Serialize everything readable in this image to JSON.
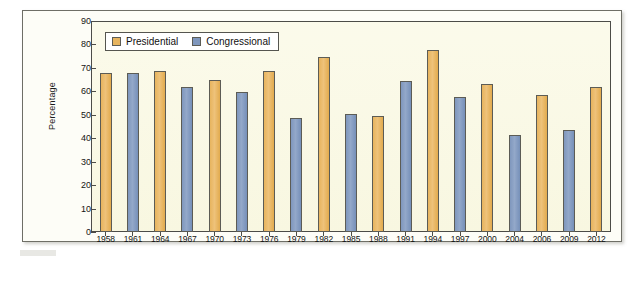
{
  "chart_data": {
    "type": "bar",
    "title": "",
    "xlabel": "",
    "ylabel": "Percentage",
    "ylim": [
      0,
      90
    ],
    "ytick_step": 10,
    "yticks": [
      90,
      80,
      70,
      60,
      50,
      40,
      30,
      20,
      10,
      0
    ],
    "grid": false,
    "legend_position": "top-left",
    "categories": [
      "1958",
      "1961",
      "1964",
      "1967",
      "1970",
      "1973",
      "1976",
      "1979",
      "1982",
      "1985",
      "1988",
      "1991",
      "1994",
      "1997",
      "2000",
      "2004",
      "2006",
      "2009",
      "2012"
    ],
    "series": [
      {
        "name": "Presidential",
        "color": "#e7b45e",
        "values": [
          68.0,
          null,
          68.8,
          null,
          64.8,
          null,
          68.6,
          null,
          74.8,
          null,
          49.3,
          null,
          77.8,
          null,
          63.2,
          null,
          58.3,
          null,
          62.0
        ]
      },
      {
        "name": "Congressional",
        "color": "#7f97bd",
        "values": [
          null,
          68.0,
          null,
          61.8,
          null,
          59.7,
          null,
          48.6,
          null,
          50.5,
          null,
          64.5,
          null,
          57.5,
          null,
          41.5,
          null,
          43.5,
          null
        ]
      }
    ],
    "bars": [
      {
        "category": "1958",
        "series": "Presidential",
        "value": 68.0
      },
      {
        "category": "1961",
        "series": "Congressional",
        "value": 68.0
      },
      {
        "category": "1964",
        "series": "Presidential",
        "value": 68.8
      },
      {
        "category": "1967",
        "series": "Congressional",
        "value": 61.8
      },
      {
        "category": "1970",
        "series": "Presidential",
        "value": 64.8
      },
      {
        "category": "1973",
        "series": "Congressional",
        "value": 59.7
      },
      {
        "category": "1976",
        "series": "Presidential",
        "value": 68.6
      },
      {
        "category": "1979",
        "series": "Congressional",
        "value": 48.6
      },
      {
        "category": "1982",
        "series": "Presidential",
        "value": 74.8
      },
      {
        "category": "1985",
        "series": "Congressional",
        "value": 50.5
      },
      {
        "category": "1988",
        "series": "Presidential",
        "value": 49.3
      },
      {
        "category": "1991",
        "series": "Congressional",
        "value": 64.5
      },
      {
        "category": "1994",
        "series": "Presidential",
        "value": 77.8
      },
      {
        "category": "1997",
        "series": "Congressional",
        "value": 57.5
      },
      {
        "category": "2000",
        "series": "Presidential",
        "value": 63.2
      },
      {
        "category": "2004",
        "series": "Congressional",
        "value": 41.5
      },
      {
        "category": "2006",
        "series": "Presidential",
        "value": 58.3
      },
      {
        "category": "2009",
        "series": "Congressional",
        "value": 43.5
      },
      {
        "category": "2012",
        "series": "Presidential",
        "value": 62.0
      }
    ]
  },
  "legend": {
    "items": [
      {
        "label": "Presidential",
        "key": "presidential"
      },
      {
        "label": "Congressional",
        "key": "congressional"
      }
    ]
  },
  "colors": {
    "presidential": "#e7b45e",
    "congressional": "#7f97bd",
    "plot_background": "#faf9e4",
    "page_background": "#fdfdf7",
    "axis": "#4c4c48"
  }
}
